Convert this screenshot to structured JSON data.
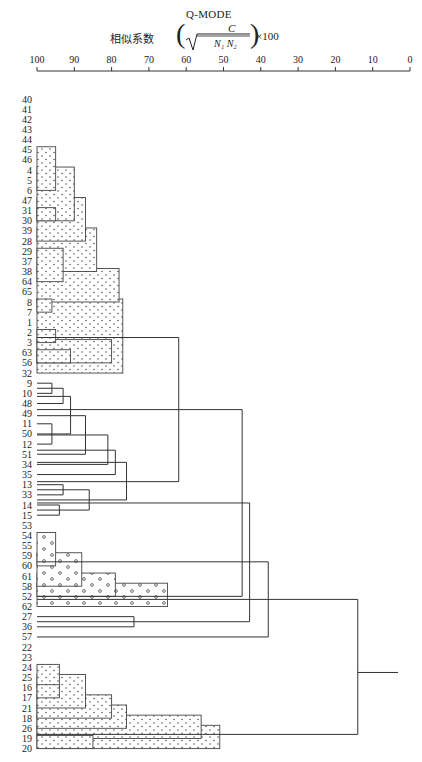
{
  "header": {
    "mode": "Q-MODE",
    "subtitle": "相似系数",
    "formula_numerator": "C",
    "formula_denominator": "N₁ N₂",
    "formula_multiplier": "×100"
  },
  "chart_data": {
    "type": "dendrogram",
    "title": "Q-MODE",
    "axis_label": "相似系数 (C / √(N1 N2)) ×100",
    "axis": {
      "min": 0,
      "max": 100,
      "reversed": true,
      "ticks": [
        100,
        90,
        80,
        70,
        60,
        50,
        40,
        30,
        20,
        10,
        0
      ]
    },
    "leaves": [
      "40",
      "41",
      "42",
      "43",
      "44",
      "45",
      "46",
      "4",
      "5",
      "6",
      "47",
      "31",
      "30",
      "39",
      "28",
      "29",
      "37",
      "38",
      "64",
      "65",
      "8",
      "7",
      "1",
      "2",
      "3",
      "63",
      "56",
      "32",
      "9",
      "10",
      "48",
      "49",
      "11",
      "50",
      "12",
      "51",
      "34",
      "35",
      "13",
      "33",
      "14",
      "15",
      "53",
      "54",
      "55",
      "59",
      "60",
      "61",
      "58",
      "52",
      "62",
      "27",
      "36",
      "57",
      "22",
      "23",
      "24",
      "25",
      "16",
      "17",
      "21",
      "18",
      "26",
      "19",
      "20"
    ],
    "stippled_boxes": [
      {
        "group": "dots",
        "similarity": 95,
        "from": 5,
        "to": 9
      },
      {
        "group": "dots",
        "similarity": 90,
        "from": 7,
        "to": 12
      },
      {
        "group": "dots",
        "similarity": 95,
        "from": 11,
        "to": 12
      },
      {
        "group": "dots",
        "similarity": 87,
        "from": 10,
        "to": 14
      },
      {
        "group": "dots",
        "similarity": 84,
        "from": 13,
        "to": 17
      },
      {
        "group": "dots",
        "similarity": 93,
        "from": 15,
        "to": 18
      },
      {
        "group": "dots",
        "similarity": 78,
        "from": 17,
        "to": 20
      },
      {
        "group": "dots",
        "similarity": 96,
        "from": 20,
        "to": 21
      },
      {
        "group": "dots",
        "similarity": 77,
        "from": 20,
        "to": 27
      },
      {
        "group": "dots",
        "similarity": 95,
        "from": 23,
        "to": 24
      },
      {
        "group": "dots",
        "similarity": 80,
        "from": 24,
        "to": 26
      },
      {
        "group": "dots",
        "similarity": 91,
        "from": 25,
        "to": 26
      },
      {
        "group": "circles",
        "similarity": 95,
        "from": 43,
        "to": 46
      },
      {
        "group": "circles",
        "similarity": 88,
        "from": 45,
        "to": 48
      },
      {
        "group": "circles",
        "similarity": 79,
        "from": 47,
        "to": 49
      },
      {
        "group": "circles",
        "similarity": 65,
        "from": 48,
        "to": 50
      },
      {
        "group": "dots",
        "similarity": 94,
        "from": 56,
        "to": 58
      },
      {
        "group": "dots",
        "similarity": 87,
        "from": 57,
        "to": 60
      },
      {
        "group": "dots",
        "similarity": 94,
        "from": 58,
        "to": 59
      },
      {
        "group": "dots",
        "similarity": 80,
        "from": 59,
        "to": 61
      },
      {
        "group": "dots",
        "similarity": 76,
        "from": 60,
        "to": 62
      },
      {
        "group": "dots",
        "similarity": 56,
        "from": 61,
        "to": 63
      },
      {
        "group": "dots",
        "similarity": 51,
        "from": 62,
        "to": 64
      },
      {
        "group": "dots",
        "similarity": 85,
        "from": 63,
        "to": 64
      }
    ],
    "links": [
      {
        "similarity": 96,
        "y1": 28,
        "y2": 29
      },
      {
        "similarity": 93,
        "y1": 28.5,
        "y2": 30
      },
      {
        "similarity": 96,
        "y1": 32,
        "y2": 34
      },
      {
        "similarity": 91,
        "y1": 29.3,
        "y2": 33
      },
      {
        "similarity": 87,
        "y1": 31.2,
        "y2": 35
      },
      {
        "similarity": 81,
        "y1": 33.1,
        "y2": 36
      },
      {
        "similarity": 79,
        "y1": 34.6,
        "y2": 37
      },
      {
        "similarity": 93,
        "y1": 38,
        "y2": 39
      },
      {
        "similarity": 94,
        "y1": 40,
        "y2": 41
      },
      {
        "similarity": 86,
        "y1": 38.5,
        "y2": 40.5
      },
      {
        "similarity": 76,
        "y1": 35.8,
        "y2": 39.5
      },
      {
        "similarity": 62,
        "y1": 23.5,
        "y2": 37.7
      },
      {
        "similarity": 74,
        "y1": 51,
        "y2": 52
      },
      {
        "similarity": 45,
        "y1": 30.6,
        "y2": 49
      },
      {
        "similarity": 43,
        "y1": 39.8,
        "y2": 51.5
      },
      {
        "similarity": 38,
        "y1": 45.6,
        "y2": 53
      },
      {
        "similarity": 14,
        "y1": 49.3,
        "y2": 62.6
      },
      {
        "similarity": 3,
        "y1": 56,
        "y2": 56,
        "stub": true
      }
    ]
  }
}
